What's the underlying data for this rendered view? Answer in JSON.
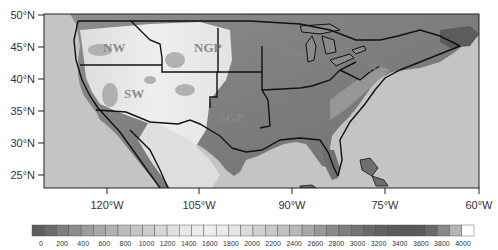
{
  "map": {
    "title": "",
    "extent": {
      "lon_min": -130,
      "lon_max": -60,
      "lat_min": 23,
      "lat_max": 50
    },
    "projection": "cylindrical equidistant",
    "variable": "Terrain elevation (m)",
    "ocean_color": "#c4c4c4",
    "lat_ticks": [
      {
        "label": "50°N",
        "lat": 50
      },
      {
        "label": "45°N",
        "lat": 45
      },
      {
        "label": "40°N",
        "lat": 40
      },
      {
        "label": "35°N",
        "lat": 35
      },
      {
        "label": "30°N",
        "lat": 30
      },
      {
        "label": "25°N",
        "lat": 25
      }
    ],
    "lon_ticks": [
      {
        "label": "120°W",
        "lon": -120
      },
      {
        "label": "105°W",
        "lon": -105
      },
      {
        "label": "90°W",
        "lon": -90
      },
      {
        "label": "75°W",
        "lon": -75
      },
      {
        "label": "60°W",
        "lon": -60
      }
    ],
    "regions": [
      {
        "label": "NW",
        "name": "Northwest"
      },
      {
        "label": "NGP",
        "name": "Northern Great Plains"
      },
      {
        "label": "SW",
        "name": "Southwest"
      },
      {
        "label": "SGP",
        "name": "Southern Great Plains"
      },
      {
        "label": "MW",
        "name": "Midwest"
      },
      {
        "label": "NE",
        "name": "Northeast"
      }
    ]
  },
  "colorbar": {
    "orientation": "horizontal",
    "labels": [
      "0",
      "200",
      "400",
      "600",
      "800",
      "1000",
      "1200",
      "1400",
      "1600",
      "1800",
      "2000",
      "2200",
      "2400",
      "2600",
      "2800",
      "3000",
      "3200",
      "3400",
      "3600",
      "3800",
      "4000"
    ],
    "colors": [
      "#5e5e5e",
      "#6c6c6c",
      "#7e7e7e",
      "#8e8e8e",
      "#9c9c9c",
      "#a8a8a8",
      "#b2b2b2",
      "#bcbcbc",
      "#c4c4c4",
      "#cccccc",
      "#d6d6d6",
      "#e0e0e0",
      "#e8e8e8",
      "#ececec",
      "#eeeeee",
      "#eaeaea",
      "#e4e4e4",
      "#dadada",
      "#d0d0d0",
      "#c8c8c8",
      "#c0c0c0",
      "#b8b8b8",
      "#a8a8a8",
      "#989898",
      "#8a8a8a",
      "#7e7e7e",
      "#747474",
      "#6a6a6a",
      "#626262",
      "#5c5c5c",
      "#585858",
      "#5a5a5a",
      "#6a6a6a",
      "#888888",
      "#b4b4b4",
      "#ffffff"
    ]
  }
}
